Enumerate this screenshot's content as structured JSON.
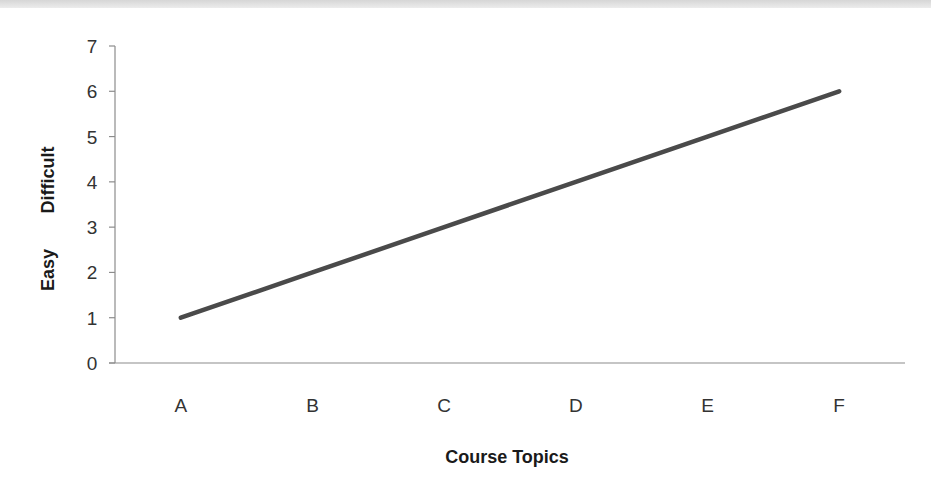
{
  "chart_data": {
    "type": "line",
    "title": "",
    "categories": [
      "A",
      "B",
      "C",
      "D",
      "E",
      "F"
    ],
    "series": [
      {
        "name": "Difficulty",
        "values": [
          1,
          2,
          3,
          4,
          5,
          6
        ],
        "color": "#4a4a4a"
      }
    ],
    "xlabel": "Course Topics",
    "ylabel_low": "Easy",
    "ylabel_high": "Difficult",
    "ylim": [
      0,
      7
    ],
    "yticks": [
      "0",
      "1",
      "2",
      "3",
      "4",
      "5",
      "6",
      "7"
    ],
    "grid": false,
    "legend": "none"
  }
}
